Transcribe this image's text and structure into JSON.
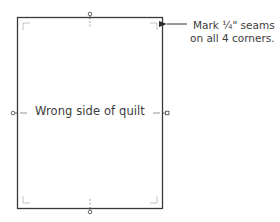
{
  "diagram": {
    "quilt_label": "Wrong side of quilt",
    "callout": {
      "line1": "Mark ¼\" seams",
      "line2": "on all 4 corners."
    },
    "colors": {
      "outline": "#3a3a3a",
      "corner_marks": "#c8c8c8",
      "text": "#3c3c3c",
      "background": "#ffffff"
    },
    "markers": [
      "top-center",
      "bottom-center",
      "left-center",
      "right-center"
    ],
    "corner_marks": [
      "top-left",
      "top-right",
      "bottom-left",
      "bottom-right"
    ]
  }
}
